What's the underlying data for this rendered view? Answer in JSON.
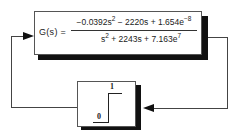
{
  "blocks": {
    "transfer_function": {
      "lhs": "G(s) =",
      "numerator": {
        "term1": "−0.0392s",
        "term1_exp": "2",
        "term2": " − 2220s + 1.654e",
        "term2_exp": "−8"
      },
      "denominator": {
        "term1": "s",
        "term1_exp": "2",
        "term2": " + 2243s + 7.163e",
        "term2_exp": "7"
      }
    },
    "step": {
      "low_label": "0",
      "high_label": "1",
      "icon": "step-function-icon"
    }
  },
  "colors": {
    "line": "#444444",
    "shadow": "#111111",
    "background": "#ffffff"
  }
}
